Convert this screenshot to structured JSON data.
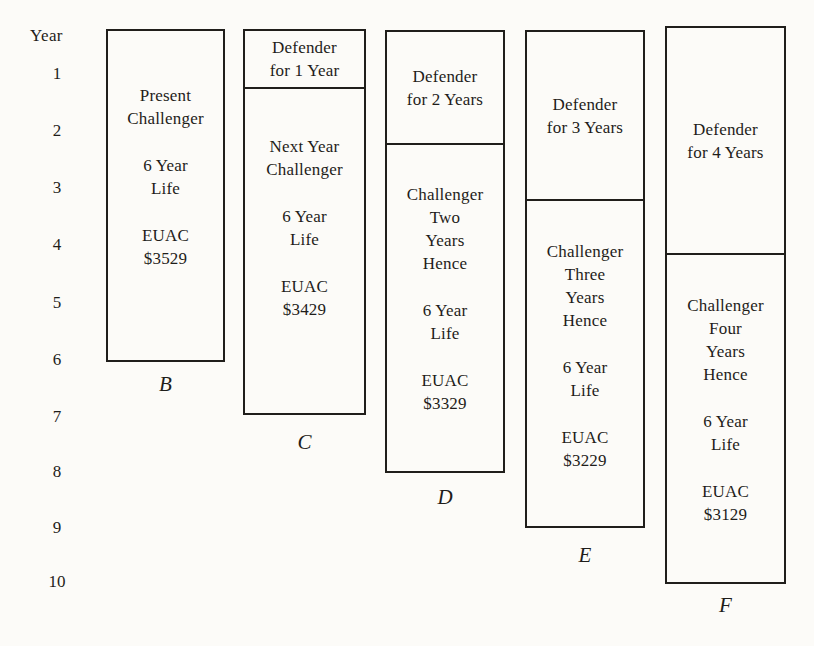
{
  "figure": {
    "background": "#fcfbf8",
    "ink": "#1f1d1a"
  },
  "axis": {
    "title": "Year",
    "ticks": [
      "1",
      "2",
      "3",
      "4",
      "5",
      "6",
      "7",
      "8",
      "9",
      "10"
    ]
  },
  "columns": [
    {
      "id": "B",
      "label": "B",
      "challenger": {
        "title": "Present\nChallenger",
        "life": "6 Year\nLife",
        "euac": "EUAC\n$3529"
      }
    },
    {
      "id": "C",
      "label": "C",
      "defender": "Defender\nfor 1 Year",
      "challenger": {
        "title": "Next Year\nChallenger",
        "life": "6 Year\nLife",
        "euac": "EUAC\n$3429"
      }
    },
    {
      "id": "D",
      "label": "D",
      "defender": "Defender\nfor 2 Years",
      "challenger": {
        "title": "Challenger\nTwo\nYears\nHence",
        "life": "6 Year\nLife",
        "euac": "EUAC\n$3329"
      }
    },
    {
      "id": "E",
      "label": "E",
      "defender": "Defender\nfor 3 Years",
      "challenger": {
        "title": "Challenger\nThree\nYears\nHence",
        "life": "6 Year\nLife",
        "euac": "EUAC\n$3229"
      }
    },
    {
      "id": "F",
      "label": "F",
      "defender": "Defender\nfor 4 Years",
      "challenger": {
        "title": "Challenger\nFour\nYears\nHence",
        "life": "6 Year\nLife",
        "euac": "EUAC\n$3129"
      }
    }
  ]
}
